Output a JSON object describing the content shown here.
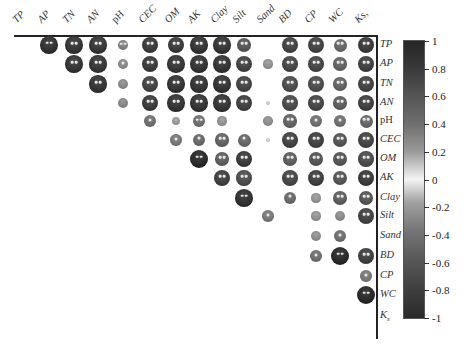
{
  "chart_data": {
    "type": "heatmap",
    "subtype": "correlation-matrix-upper-triangle",
    "title": "",
    "variables": [
      "TP",
      "AP",
      "TN",
      "AN",
      "pH",
      "CEC",
      "OM",
      "AK",
      "Clay",
      "Silt",
      "Sand",
      "BD",
      "CP",
      "WC",
      "Ks"
    ],
    "column_labels": [
      "TP",
      "AP",
      "TN",
      "AN",
      "pH",
      "CEC",
      "OM",
      "AK",
      "Clay",
      "Silt",
      "Sand",
      "BD",
      "CP",
      "WC",
      "K_s"
    ],
    "row_labels": [
      "TP",
      "AP",
      "TN",
      "AN",
      "pH",
      "CEC",
      "OM",
      "AK",
      "Clay",
      "Silt",
      "Sand",
      "BD",
      "CP",
      "WC",
      "K_s"
    ],
    "cells": [
      {
        "row": "TP",
        "col": "AP",
        "r": 0.9,
        "sig": "**"
      },
      {
        "row": "TP",
        "col": "TN",
        "r": 0.88,
        "sig": "**"
      },
      {
        "row": "TP",
        "col": "AN",
        "r": 0.87,
        "sig": "**"
      },
      {
        "row": "TP",
        "col": "pH",
        "r": 0.45,
        "sig": "**"
      },
      {
        "row": "TP",
        "col": "CEC",
        "r": 0.85,
        "sig": "**"
      },
      {
        "row": "TP",
        "col": "OM",
        "r": 0.85,
        "sig": "**"
      },
      {
        "row": "TP",
        "col": "AK",
        "r": 0.88,
        "sig": "**"
      },
      {
        "row": "TP",
        "col": "Clay",
        "r": 0.88,
        "sig": "**"
      },
      {
        "row": "TP",
        "col": "Silt",
        "r": 0.7,
        "sig": "**"
      },
      {
        "row": "TP",
        "col": "BD",
        "r": 0.8,
        "sig": "**"
      },
      {
        "row": "TP",
        "col": "CP",
        "r": 0.8,
        "sig": "**"
      },
      {
        "row": "TP",
        "col": "WC",
        "r": 0.6,
        "sig": "**"
      },
      {
        "row": "TP",
        "col": "Ks",
        "r": 0.85,
        "sig": "**"
      },
      {
        "row": "AP",
        "col": "TN",
        "r": 0.88,
        "sig": "**"
      },
      {
        "row": "AP",
        "col": "AN",
        "r": 0.87,
        "sig": "**"
      },
      {
        "row": "AP",
        "col": "pH",
        "r": 0.4,
        "sig": "*"
      },
      {
        "row": "AP",
        "col": "CEC",
        "r": 0.85,
        "sig": "**"
      },
      {
        "row": "AP",
        "col": "OM",
        "r": 0.87,
        "sig": "**"
      },
      {
        "row": "AP",
        "col": "AK",
        "r": 0.88,
        "sig": "**"
      },
      {
        "row": "AP",
        "col": "Clay",
        "r": 0.88,
        "sig": "**"
      },
      {
        "row": "AP",
        "col": "Silt",
        "r": 0.8,
        "sig": "**"
      },
      {
        "row": "AP",
        "col": "Sand",
        "r": 0.35,
        "sig": ""
      },
      {
        "row": "AP",
        "col": "BD",
        "r": 0.78,
        "sig": "**"
      },
      {
        "row": "AP",
        "col": "CP",
        "r": 0.78,
        "sig": "**"
      },
      {
        "row": "AP",
        "col": "WC",
        "r": 0.62,
        "sig": "**"
      },
      {
        "row": "AP",
        "col": "Ks",
        "r": 0.82,
        "sig": "**"
      },
      {
        "row": "TN",
        "col": "AN",
        "r": 0.88,
        "sig": "**"
      },
      {
        "row": "TN",
        "col": "pH",
        "r": 0.4,
        "sig": ""
      },
      {
        "row": "TN",
        "col": "CEC",
        "r": 0.8,
        "sig": "**"
      },
      {
        "row": "TN",
        "col": "OM",
        "r": 0.88,
        "sig": "**"
      },
      {
        "row": "TN",
        "col": "AK",
        "r": 0.88,
        "sig": "**"
      },
      {
        "row": "TN",
        "col": "Clay",
        "r": 0.88,
        "sig": "**"
      },
      {
        "row": "TN",
        "col": "Silt",
        "r": 0.8,
        "sig": "**"
      },
      {
        "row": "TN",
        "col": "BD",
        "r": 0.75,
        "sig": "**"
      },
      {
        "row": "TN",
        "col": "CP",
        "r": 0.75,
        "sig": "**"
      },
      {
        "row": "TN",
        "col": "WC",
        "r": 0.62,
        "sig": "**"
      },
      {
        "row": "TN",
        "col": "Ks",
        "r": 0.8,
        "sig": "**"
      },
      {
        "row": "AN",
        "col": "pH",
        "r": 0.42,
        "sig": ""
      },
      {
        "row": "AN",
        "col": "CEC",
        "r": 0.85,
        "sig": "**"
      },
      {
        "row": "AN",
        "col": "OM",
        "r": 0.88,
        "sig": "**"
      },
      {
        "row": "AN",
        "col": "AK",
        "r": 0.88,
        "sig": "**"
      },
      {
        "row": "AN",
        "col": "Clay",
        "r": 0.88,
        "sig": "**"
      },
      {
        "row": "AN",
        "col": "Silt",
        "r": 0.82,
        "sig": "**"
      },
      {
        "row": "AN",
        "col": "Sand",
        "r": 0.05,
        "sig": ""
      },
      {
        "row": "AN",
        "col": "BD",
        "r": 0.76,
        "sig": "**"
      },
      {
        "row": "AN",
        "col": "CP",
        "r": 0.78,
        "sig": "**"
      },
      {
        "row": "AN",
        "col": "WC",
        "r": 0.65,
        "sig": "**"
      },
      {
        "row": "AN",
        "col": "Ks",
        "r": 0.82,
        "sig": "**"
      },
      {
        "row": "pH",
        "col": "CEC",
        "r": 0.55,
        "sig": "*"
      },
      {
        "row": "pH",
        "col": "OM",
        "r": 0.3,
        "sig": ""
      },
      {
        "row": "pH",
        "col": "AK",
        "r": 0.55,
        "sig": "**"
      },
      {
        "row": "pH",
        "col": "Clay",
        "r": 0.35,
        "sig": ""
      },
      {
        "row": "pH",
        "col": "Sand",
        "r": 0.38,
        "sig": ""
      },
      {
        "row": "pH",
        "col": "BD",
        "r": 0.62,
        "sig": "**"
      },
      {
        "row": "pH",
        "col": "CP",
        "r": 0.55,
        "sig": "*"
      },
      {
        "row": "pH",
        "col": "WC",
        "r": 0.55,
        "sig": "*"
      },
      {
        "row": "pH",
        "col": "Ks",
        "r": 0.6,
        "sig": "**"
      },
      {
        "row": "CEC",
        "col": "OM",
        "r": 0.5,
        "sig": "*"
      },
      {
        "row": "CEC",
        "col": "AK",
        "r": 0.58,
        "sig": "*"
      },
      {
        "row": "CEC",
        "col": "Clay",
        "r": 0.62,
        "sig": "**"
      },
      {
        "row": "CEC",
        "col": "Silt",
        "r": 0.6,
        "sig": "*"
      },
      {
        "row": "CEC",
        "col": "Sand",
        "r": 0.05,
        "sig": ""
      },
      {
        "row": "CEC",
        "col": "BD",
        "r": 0.8,
        "sig": "**"
      },
      {
        "row": "CEC",
        "col": "CP",
        "r": 0.82,
        "sig": "**"
      },
      {
        "row": "CEC",
        "col": "WC",
        "r": 0.7,
        "sig": "**"
      },
      {
        "row": "CEC",
        "col": "Ks",
        "r": 0.8,
        "sig": "**"
      },
      {
        "row": "OM",
        "col": "AK",
        "r": 0.95,
        "sig": "**"
      },
      {
        "row": "OM",
        "col": "Clay",
        "r": 0.65,
        "sig": "**"
      },
      {
        "row": "OM",
        "col": "Silt",
        "r": 0.85,
        "sig": "**"
      },
      {
        "row": "OM",
        "col": "BD",
        "r": 0.65,
        "sig": "**"
      },
      {
        "row": "OM",
        "col": "CP",
        "r": 0.7,
        "sig": "**"
      },
      {
        "row": "OM",
        "col": "WC",
        "r": 0.7,
        "sig": "**"
      },
      {
        "row": "OM",
        "col": "Ks",
        "r": 0.75,
        "sig": "**"
      },
      {
        "row": "AK",
        "col": "Clay",
        "r": 0.82,
        "sig": "**"
      },
      {
        "row": "AK",
        "col": "Silt",
        "r": 0.75,
        "sig": "**"
      },
      {
        "row": "AK",
        "col": "BD",
        "r": 0.78,
        "sig": "**"
      },
      {
        "row": "AK",
        "col": "CP",
        "r": 0.82,
        "sig": "**"
      },
      {
        "row": "AK",
        "col": "WC",
        "r": 0.7,
        "sig": "**"
      },
      {
        "row": "AK",
        "col": "Ks",
        "r": 0.85,
        "sig": "**"
      },
      {
        "row": "Clay",
        "col": "Silt",
        "r": 0.9,
        "sig": "**"
      },
      {
        "row": "Clay",
        "col": "BD",
        "r": 0.58,
        "sig": "*"
      },
      {
        "row": "Clay",
        "col": "CP",
        "r": 0.35,
        "sig": ""
      },
      {
        "row": "Clay",
        "col": "WC",
        "r": 0.65,
        "sig": "**"
      },
      {
        "row": "Clay",
        "col": "Ks",
        "r": 0.7,
        "sig": "**"
      },
      {
        "row": "Silt",
        "col": "Sand",
        "r": 0.5,
        "sig": "*"
      },
      {
        "row": "Silt",
        "col": "CP",
        "r": 0.35,
        "sig": ""
      },
      {
        "row": "Silt",
        "col": "WC",
        "r": 0.4,
        "sig": ""
      },
      {
        "row": "Silt",
        "col": "Ks",
        "r": 0.8,
        "sig": "**"
      },
      {
        "row": "Sand",
        "col": "CP",
        "r": 0.38,
        "sig": ""
      },
      {
        "row": "Sand",
        "col": "WC",
        "r": 0.55,
        "sig": "*"
      },
      {
        "row": "BD",
        "col": "CP",
        "r": 0.55,
        "sig": "*"
      },
      {
        "row": "BD",
        "col": "WC",
        "r": 0.95,
        "sig": "**"
      },
      {
        "row": "BD",
        "col": "Ks",
        "r": 0.82,
        "sig": "**"
      },
      {
        "row": "CP",
        "col": "Ks",
        "r": 0.5,
        "sig": "*"
      },
      {
        "row": "WC",
        "col": "Ks",
        "r": 0.95,
        "sig": "**"
      }
    ],
    "colorbar": {
      "range": [
        -1,
        1
      ],
      "ticks": [
        "1",
        "0.8",
        "0.6",
        "0.4",
        "0.2",
        "0",
        "-0.2",
        "-0.4",
        "-0.6",
        "-0.8",
        "-1"
      ],
      "colors": {
        "high": "#262626",
        "mid": "#f4f4f4",
        "low": "#2a2a2a"
      }
    },
    "legend_position": "right",
    "grid": false
  },
  "caption": "图 3 土壤理化性质相关性"
}
